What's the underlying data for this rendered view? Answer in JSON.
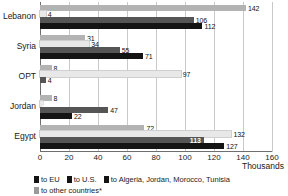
{
  "chart_data": {
    "type": "bar",
    "orientation": "horizontal",
    "title": "",
    "subtitle": "",
    "xlabel": "Thousands",
    "ylabel": "",
    "xlim": [
      0,
      160
    ],
    "xticks": [
      0,
      20,
      40,
      60,
      80,
      100,
      120,
      140,
      160
    ],
    "grid": true,
    "grid_axis": "x",
    "legend_position": "bottom-left",
    "categories": [
      "Lebanon",
      "Syria",
      "OPT",
      "Jordan",
      "Egypt"
    ],
    "series": [
      {
        "name": "to EU",
        "color": "#b3b3b3",
        "values": [
          142,
          31,
          8,
          8,
          72
        ]
      },
      {
        "name": "to U.S.",
        "color": "#e8e8e8",
        "values": [
          4,
          34,
          97,
          2,
          132
        ]
      },
      {
        "name": "to Algeria, Jordan, Morocco, Tunisia",
        "color": "#555555",
        "values": [
          106,
          55,
          4,
          47,
          113
        ]
      },
      {
        "name": "to other countries*",
        "color": "#141414",
        "values": [
          112,
          71,
          0,
          22,
          127
        ]
      }
    ],
    "value_labels": {
      "Lebanon": [
        "142",
        "4",
        "106",
        "112"
      ],
      "Syria": [
        "31",
        "34",
        "55",
        "71"
      ],
      "OPT": [
        "8",
        "97",
        "4",
        ""
      ],
      "Jordan": [
        "8",
        "2",
        "47",
        "22"
      ],
      "Egypt": [
        "72",
        "132",
        "113",
        "127"
      ]
    },
    "label_placement": {
      "Lebanon": [
        "outside",
        "outside",
        "outside",
        "outside"
      ],
      "Syria": [
        "outside",
        "outside",
        "outside",
        "outside"
      ],
      "OPT": [
        "outside",
        "outside",
        "outside",
        "outside"
      ],
      "Jordan": [
        "outside",
        "inside",
        "outside",
        "outside"
      ],
      "Egypt": [
        "outside",
        "outside",
        "inside",
        "outside"
      ]
    }
  },
  "axis": {
    "tick_labels": [
      "0",
      "20",
      "40",
      "60",
      "80",
      "100",
      "120",
      "140",
      "160"
    ],
    "units_label": "Thousands"
  },
  "legend": {
    "row1": [
      {
        "label": "to EU",
        "color": "#141414"
      },
      {
        "label": "to U.S.",
        "color": "#141414"
      },
      {
        "label": "to Algeria, Jordan, Morocco, Tunisia",
        "color": "#141414"
      }
    ],
    "row2": [
      {
        "label": "to other countries*",
        "color": "#9a9a9a"
      }
    ]
  }
}
